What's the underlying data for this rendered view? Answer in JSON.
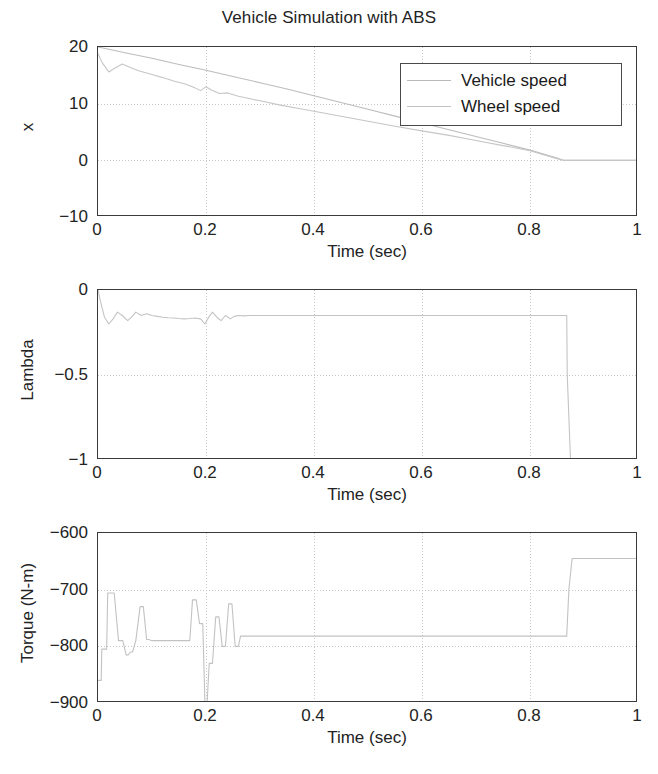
{
  "figure": {
    "title": "Vehicle Simulation with ABS",
    "width": 658,
    "height": 774,
    "background": "#ffffff",
    "axis_color": "#3a3a3a",
    "grid_color": "#c9c9c9"
  },
  "legend": {
    "position": "top-right of first subplot",
    "entries": [
      {
        "label": "Vehicle speed",
        "color": "#b9b9b9"
      },
      {
        "label": "Wheel speed",
        "color": "#c3c3c3"
      }
    ]
  },
  "chart_data": [
    {
      "id": "speed",
      "type": "line",
      "title": "Vehicle Simulation with ABS",
      "xlabel": "Time (sec)",
      "ylabel": "x",
      "xlim": [
        0,
        1
      ],
      "ylim": [
        -10,
        20
      ],
      "xticks": [
        0,
        0.2,
        0.4,
        0.6,
        0.8,
        1
      ],
      "xticklabels": [
        "0",
        "0.2",
        "0.4",
        "0.6",
        "0.8",
        "1"
      ],
      "yticks": [
        -10,
        0,
        10,
        20
      ],
      "yticklabels": [
        "−10",
        "0",
        "10",
        "20"
      ],
      "grid": true,
      "series": [
        {
          "name": "Vehicle speed",
          "color": "#bcbcbc",
          "x": [
            0,
            0.02,
            0.05,
            0.1,
            0.15,
            0.2,
            0.25,
            0.3,
            0.35,
            0.4,
            0.45,
            0.5,
            0.55,
            0.6,
            0.65,
            0.7,
            0.75,
            0.8,
            0.85,
            0.862,
            1
          ],
          "y": [
            20,
            19.6,
            19.0,
            18.0,
            16.9,
            15.9,
            14.8,
            13.7,
            12.6,
            11.4,
            10.2,
            9.0,
            7.8,
            6.6,
            5.4,
            4.2,
            3.0,
            1.8,
            0.4,
            0,
            0
          ]
        },
        {
          "name": "Wheel speed",
          "color": "#c6c6c6",
          "x": [
            0,
            0.008,
            0.02,
            0.03,
            0.045,
            0.06,
            0.075,
            0.09,
            0.105,
            0.12,
            0.14,
            0.16,
            0.175,
            0.19,
            0.2,
            0.21,
            0.225,
            0.24,
            0.26,
            0.28,
            0.3,
            0.34,
            0.38,
            0.42,
            0.46,
            0.5,
            0.55,
            0.6,
            0.65,
            0.7,
            0.75,
            0.8,
            0.85,
            0.862,
            1
          ],
          "y": [
            18.8,
            17.2,
            15.6,
            16.2,
            17.0,
            16.4,
            15.8,
            15.4,
            15.0,
            14.6,
            14.0,
            13.5,
            13.0,
            12.3,
            13.0,
            12.4,
            11.8,
            11.9,
            11.3,
            10.9,
            10.5,
            9.7,
            9.0,
            8.3,
            7.6,
            6.9,
            6.0,
            5.2,
            4.4,
            3.5,
            2.6,
            1.7,
            0.3,
            0,
            0
          ]
        }
      ]
    },
    {
      "id": "lambda",
      "type": "line",
      "xlabel": "Time (sec)",
      "ylabel": "Lambda",
      "xlim": [
        0,
        1
      ],
      "ylim": [
        -1,
        0
      ],
      "xticks": [
        0,
        0.2,
        0.4,
        0.6,
        0.8,
        1
      ],
      "xticklabels": [
        "0",
        "0.2",
        "0.4",
        "0.6",
        "0.8",
        "1"
      ],
      "yticks": [
        -1,
        -0.5,
        0
      ],
      "yticklabels": [
        "−1",
        "−0.5",
        "0"
      ],
      "grid": true,
      "series": [
        {
          "name": "Lambda",
          "color": "#c4c4c4",
          "x": [
            0,
            0.004,
            0.012,
            0.02,
            0.028,
            0.036,
            0.045,
            0.055,
            0.062,
            0.07,
            0.08,
            0.09,
            0.1,
            0.11,
            0.12,
            0.13,
            0.14,
            0.15,
            0.16,
            0.17,
            0.18,
            0.19,
            0.198,
            0.205,
            0.212,
            0.22,
            0.228,
            0.236,
            0.245,
            0.252,
            0.26,
            0.27,
            0.28,
            0.3,
            0.35,
            0.45,
            0.6,
            0.75,
            0.85,
            0.868,
            0.869,
            0.875,
            1
          ],
          "y": [
            0,
            -0.06,
            -0.16,
            -0.2,
            -0.17,
            -0.13,
            -0.15,
            -0.18,
            -0.16,
            -0.13,
            -0.15,
            -0.14,
            -0.15,
            -0.155,
            -0.16,
            -0.163,
            -0.165,
            -0.168,
            -0.17,
            -0.168,
            -0.165,
            -0.17,
            -0.2,
            -0.16,
            -0.13,
            -0.16,
            -0.18,
            -0.15,
            -0.17,
            -0.155,
            -0.15,
            -0.152,
            -0.15,
            -0.15,
            -0.15,
            -0.15,
            -0.15,
            -0.15,
            -0.15,
            -0.15,
            -0.5,
            -1,
            -1
          ]
        }
      ]
    },
    {
      "id": "torque",
      "type": "line",
      "xlabel": "Time (sec)",
      "ylabel": "Torque (N-m)",
      "xlim": [
        0,
        1
      ],
      "ylim": [
        -900,
        -600
      ],
      "xticks": [
        0,
        0.2,
        0.4,
        0.6,
        0.8,
        1
      ],
      "xticklabels": [
        "0",
        "0.2",
        "0.4",
        "0.6",
        "0.8",
        "1"
      ],
      "yticks": [
        -900,
        -800,
        -700,
        -600
      ],
      "yticklabels": [
        "−900",
        "−800",
        "−700",
        "−600"
      ],
      "grid": true,
      "series": [
        {
          "name": "Torque",
          "color": "#c2c2c2",
          "x": [
            0,
            0.006,
            0.007,
            0.016,
            0.018,
            0.03,
            0.038,
            0.046,
            0.052,
            0.056,
            0.06,
            0.064,
            0.07,
            0.074,
            0.078,
            0.084,
            0.09,
            0.094,
            0.1,
            0.17,
            0.175,
            0.182,
            0.188,
            0.194,
            0.198,
            0.202,
            0.206,
            0.212,
            0.218,
            0.224,
            0.23,
            0.236,
            0.242,
            0.248,
            0.254,
            0.26,
            0.264,
            0.268,
            0.3,
            0.45,
            0.6,
            0.75,
            0.86,
            0.868,
            0.872,
            0.878,
            1
          ],
          "y": [
            -860,
            -860,
            -805,
            -805,
            -706,
            -706,
            -790,
            -790,
            -815,
            -815,
            -810,
            -810,
            -790,
            -760,
            -730,
            -730,
            -788,
            -788,
            -790,
            -790,
            -718,
            -718,
            -760,
            -760,
            -900,
            -900,
            -830,
            -830,
            -748,
            -748,
            -800,
            -800,
            -725,
            -725,
            -800,
            -800,
            -782,
            -782,
            -782,
            -782,
            -782,
            -782,
            -782,
            -782,
            -700,
            -645,
            -645
          ]
        }
      ]
    }
  ]
}
